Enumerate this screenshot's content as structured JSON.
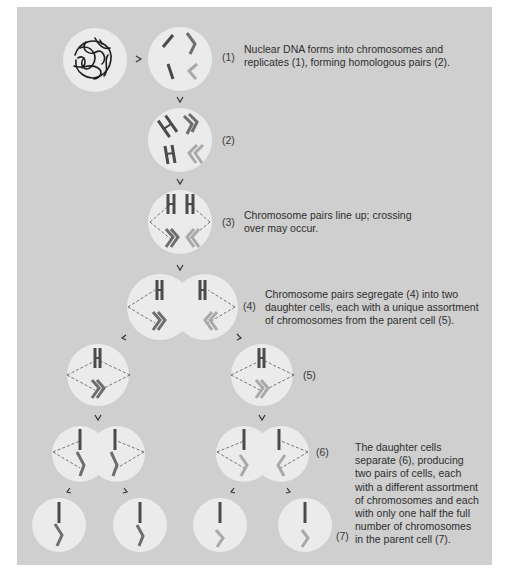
{
  "colors": {
    "panel": "#cfcfcf",
    "cell": "#ebebeb",
    "chromosome_dark": "#4a4a4a",
    "chromosome_mid": "#707070",
    "chromosome_light": "#a8a8a8",
    "text": "#2e2e2e"
  },
  "arrows": {
    "right": ">",
    "down": "v"
  },
  "step_labels": {
    "s1": "(1)",
    "s2": "(2)",
    "s3": "(3)",
    "s4": "(4)",
    "s5": "(5)",
    "s6": "(6)",
    "s7": "(7)"
  },
  "descriptions": {
    "step1": [
      "Nuclear DNA forms into chromosomes and",
      "replicates (1), forming homologous pairs (2)."
    ],
    "step3": [
      "Chromosome pairs line up; crossing",
      "over may occur."
    ],
    "step4": [
      "Chromosome pairs segregate (4) into two",
      "daughter cells, each with a unique assortment",
      "of chromosomes from the parent cell (5)."
    ],
    "step6": [
      "The daughter cells",
      "separate (6), producing",
      "two pairs of cells, each",
      "with a different assortment",
      "of chromosomes and each",
      "with only one half the full",
      "number of chromosomes",
      "in the parent cell (7)."
    ]
  }
}
